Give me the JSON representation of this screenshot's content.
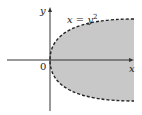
{
  "figure": {
    "x_axis_label": "x",
    "y_axis_label": "y",
    "origin_label": "0",
    "curve_label_lhs": "x = y",
    "curve_label_exp": "2",
    "colors": {
      "shade": "#c8c8c8",
      "axis": "#333333",
      "curve": "#222222",
      "background": "#ffffff"
    }
  }
}
